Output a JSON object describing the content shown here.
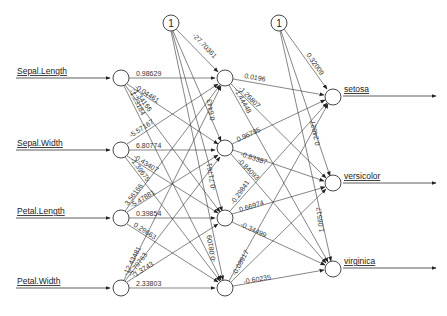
{
  "diagram": {
    "type": "neural-network",
    "inputs": [
      {
        "label": "Sepal.Length"
      },
      {
        "label": "Sepal.Width"
      },
      {
        "label": "Petal.Length"
      },
      {
        "label": "Petal.Width"
      }
    ],
    "outputs": [
      {
        "label": "setosa"
      },
      {
        "label": "versicolor"
      },
      {
        "label": "virginica"
      }
    ],
    "bias_label": "1",
    "hidden_count": 4,
    "weights_input_hidden_visible": [
      {
        "from": 0,
        "to": 0,
        "value": "0.98629"
      },
      {
        "from": 1,
        "to": 1,
        "value": "6.80774"
      },
      {
        "from": 2,
        "to": 2,
        "value": "0.39854"
      },
      {
        "from": 3,
        "to": 3,
        "value": "2.33803"
      },
      {
        "from": 0,
        "to": 1,
        "value": "-0.04461"
      },
      {
        "from": 0,
        "to": 2,
        "value": "-1.34166"
      },
      {
        "from": 0,
        "to": 3,
        "value": "-1.23184"
      },
      {
        "from": 1,
        "to": 0,
        "value": "-5.57167"
      },
      {
        "from": 1,
        "to": 2,
        "value": "-0.43407"
      },
      {
        "from": 1,
        "to": 3,
        "value": "-1.39675"
      },
      {
        "from": 2,
        "to": 0,
        "value": "3.56166"
      },
      {
        "from": 2,
        "to": 1,
        "value": "-5.47881"
      },
      {
        "from": 2,
        "to": 3,
        "value": "0.29663"
      },
      {
        "from": 3,
        "to": 0,
        "value": "-12.43481"
      },
      {
        "from": 3,
        "to": 1,
        "value": "-5.79763"
      },
      {
        "from": 3,
        "to": 2,
        "value": "-1.3743"
      }
    ],
    "weights_bias_hidden": [
      {
        "to": 0,
        "value": "-27.70361"
      },
      {
        "to": 1,
        "value": "0.6443"
      },
      {
        "to": 2,
        "value": "-0.71761"
      },
      {
        "to": 3,
        "value": "-0.08109"
      }
    ],
    "weights_hidden_output_visible": [
      {
        "from": 0,
        "to": 0,
        "value": "0.0196"
      },
      {
        "from": 0,
        "to": 1,
        "value": "-1.26807"
      },
      {
        "from": 0,
        "to": 2,
        "value": "-1.44448"
      },
      {
        "from": 1,
        "to": 0,
        "value": "0.96795"
      },
      {
        "from": 1,
        "to": 1,
        "value": "-0.83387"
      },
      {
        "from": 1,
        "to": 2,
        "value": "-0.84093"
      },
      {
        "from": 2,
        "to": 0,
        "value": "-0.29841"
      },
      {
        "from": 2,
        "to": 1,
        "value": "0.66974"
      },
      {
        "from": 2,
        "to": 2,
        "value": "-0.34499"
      },
      {
        "from": 3,
        "to": 0,
        "value": "-0.08917"
      },
      {
        "from": 3,
        "to": 2,
        "value": "-0.60235"
      }
    ],
    "weights_bias_output": [
      {
        "to": 0,
        "value": "0.32009"
      },
      {
        "to": 1,
        "value": "0.24027"
      },
      {
        "to": 2,
        "value": "1.06517"
      }
    ]
  }
}
